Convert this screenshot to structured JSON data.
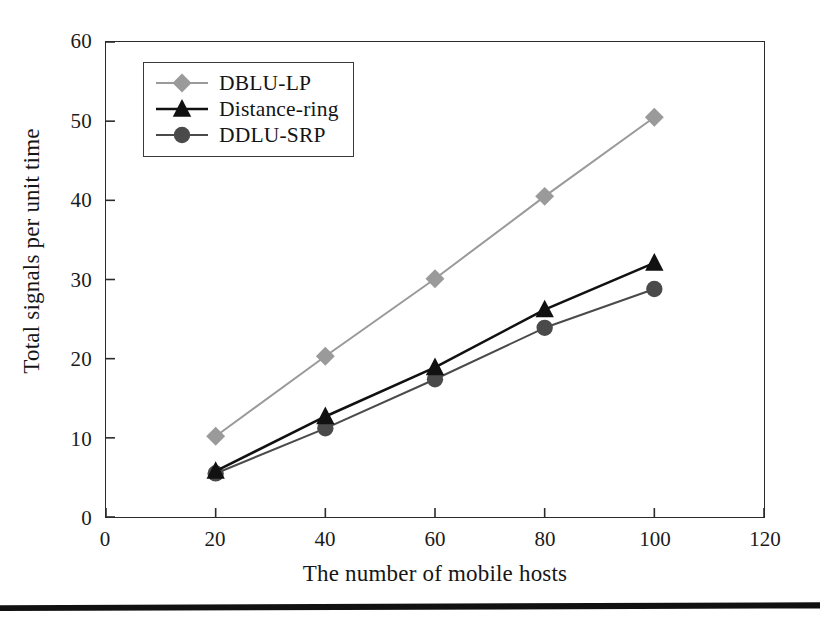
{
  "figure": {
    "background_color": "#ffffff",
    "axis_color": "#2b2b2b"
  },
  "chart_data": {
    "type": "line",
    "title": "",
    "xlabel": "The number of mobile hosts",
    "ylabel": "Total signals per unit time",
    "xlim": [
      0,
      120
    ],
    "ylim": [
      0,
      60
    ],
    "xticks": [
      0,
      20,
      40,
      60,
      80,
      100,
      120
    ],
    "yticks": [
      0,
      10,
      20,
      30,
      40,
      50,
      60
    ],
    "xtick_labels": [
      "0",
      "20",
      "40",
      "60",
      "80",
      "100",
      "120"
    ],
    "ytick_labels": [
      "0",
      "10",
      "20",
      "30",
      "40",
      "50",
      "60"
    ],
    "grid": false,
    "legend_position": "upper-left-inside",
    "x": [
      20,
      40,
      60,
      80,
      100
    ],
    "series": [
      {
        "name": "DBLU-LP",
        "values": [
          10.2,
          20.3,
          30.1,
          40.5,
          50.5
        ],
        "color": "#9a9a9a",
        "marker": "diamond",
        "line_width": 2.0
      },
      {
        "name": "Distance-ring",
        "values": [
          5.8,
          12.7,
          18.9,
          26.2,
          32.1
        ],
        "color": "#111111",
        "marker": "triangle",
        "line_width": 2.6
      },
      {
        "name": "DDLU-SRP",
        "values": [
          5.5,
          11.2,
          17.4,
          23.9,
          28.8
        ],
        "color": "#4a4a4a",
        "marker": "circle",
        "line_width": 2.0
      }
    ]
  },
  "legend": {
    "items": [
      {
        "label": "DBLU-LP"
      },
      {
        "label": "Distance-ring"
      },
      {
        "label": "DDLU-SRP"
      }
    ]
  }
}
